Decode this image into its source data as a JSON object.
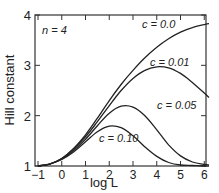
{
  "chart_data": {
    "type": "line",
    "title": "",
    "annotation": "n = 4",
    "xlabel": "log L",
    "ylabel": "Hill constant",
    "xlim": [
      -1,
      6.2
    ],
    "ylim": [
      1,
      4
    ],
    "xticks": [
      -1,
      0,
      1,
      2,
      3,
      4,
      5,
      6
    ],
    "yticks": [
      1,
      2,
      3,
      4
    ],
    "grid": false,
    "legend": "inline labels",
    "x": [
      -1,
      -0.5,
      0,
      0.5,
      1,
      1.5,
      2,
      2.5,
      3,
      3.5,
      4,
      4.5,
      5,
      5.5,
      6,
      6.2
    ],
    "series": [
      {
        "name": "c = 0.0",
        "values": [
          1.0,
          1.04,
          1.15,
          1.35,
          1.62,
          1.95,
          2.3,
          2.62,
          2.9,
          3.15,
          3.36,
          3.53,
          3.66,
          3.75,
          3.81,
          3.83
        ]
      },
      {
        "name": "c = 0.01",
        "values": [
          1.0,
          1.04,
          1.15,
          1.34,
          1.58,
          1.88,
          2.2,
          2.5,
          2.74,
          2.9,
          2.97,
          2.95,
          2.84,
          2.66,
          2.45,
          2.36
        ]
      },
      {
        "name": "c = 0.05",
        "values": [
          1.0,
          1.04,
          1.14,
          1.31,
          1.53,
          1.8,
          2.05,
          2.19,
          2.17,
          2.0,
          1.72,
          1.42,
          1.2,
          1.08,
          1.03,
          1.02
        ]
      },
      {
        "name": "c = 0.10",
        "values": [
          1.0,
          1.04,
          1.13,
          1.28,
          1.48,
          1.68,
          1.79,
          1.76,
          1.6,
          1.38,
          1.19,
          1.07,
          1.02,
          1.01,
          1.0,
          1.0
        ]
      }
    ]
  },
  "labels": {
    "n": "n = 4",
    "xlabel": "log L",
    "ylabel": "Hill constant",
    "c0": "c = 0.0",
    "c001": "c = 0.01",
    "c005": "c = 0.05",
    "c010": "c = 0.10"
  }
}
